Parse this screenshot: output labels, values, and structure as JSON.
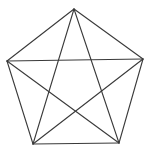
{
  "diagram": {
    "title": "",
    "stroke_color": "#3a3a3a",
    "background": "#ffffff",
    "vertices": [
      {
        "id": "top",
        "x": 74,
        "y": 9
      },
      {
        "id": "right",
        "x": 143,
        "y": 59
      },
      {
        "id": "bottom-right",
        "x": 119,
        "y": 143
      },
      {
        "id": "bottom-left",
        "x": 33,
        "y": 144
      },
      {
        "id": "left",
        "x": 7,
        "y": 61
      }
    ],
    "edges": [
      {
        "type": "side",
        "from": 0,
        "to": 1
      },
      {
        "type": "side",
        "from": 1,
        "to": 2
      },
      {
        "type": "side",
        "from": 2,
        "to": 3
      },
      {
        "type": "side",
        "from": 3,
        "to": 4
      },
      {
        "type": "side",
        "from": 4,
        "to": 0
      },
      {
        "type": "diagonal",
        "from": 0,
        "to": 2
      },
      {
        "type": "diagonal",
        "from": 0,
        "to": 3
      },
      {
        "type": "diagonal",
        "from": 1,
        "to": 3
      },
      {
        "type": "diagonal",
        "from": 1,
        "to": 4
      },
      {
        "type": "diagonal",
        "from": 2,
        "to": 4
      }
    ]
  }
}
